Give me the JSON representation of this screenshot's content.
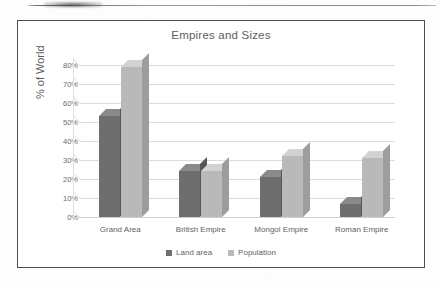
{
  "artifacts": {
    "top_rule": "scan-rule",
    "smudge": "scan-smudge"
  },
  "chart_data": {
    "type": "bar",
    "title": "Empires and Sizes",
    "xlabel": "",
    "ylabel": "% of World",
    "categories": [
      "Grand Area",
      "British Empire",
      "Mongol Empire",
      "Roman Empire"
    ],
    "series": [
      {
        "name": "Land area",
        "color": "#6e6e6e",
        "values": [
          53,
          24,
          21,
          7
        ]
      },
      {
        "name": "Population",
        "color": "#b9b9b9",
        "values": [
          79,
          24,
          32,
          31
        ]
      }
    ],
    "ylim": [
      0,
      80
    ],
    "ytick_step": 10,
    "ytick_labels": [
      "0%",
      "10%",
      "20%",
      "30%",
      "40%",
      "50%",
      "60%",
      "70%",
      "80%"
    ],
    "ytick_values": [
      0,
      10,
      20,
      30,
      40,
      50,
      60,
      70,
      80
    ],
    "grid": true,
    "legend_position": "bottom",
    "three_d": true
  }
}
